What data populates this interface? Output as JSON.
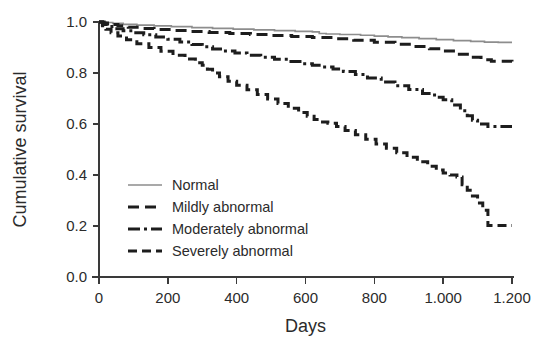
{
  "chart_data": {
    "type": "line",
    "title": "",
    "subtitle": "",
    "xlabel": "Days",
    "ylabel": "Cumulative survival",
    "xlim": [
      0,
      1200
    ],
    "ylim": [
      0.0,
      1.0
    ],
    "grid": false,
    "legend_position": "inside-lower-left",
    "x_ticks": [
      0,
      200,
      400,
      600,
      800,
      1000,
      1200
    ],
    "x_tick_labels": [
      "0",
      "200",
      "400",
      "600",
      "800",
      "1.000",
      "1.200"
    ],
    "y_ticks": [
      0.0,
      0.2,
      0.4,
      0.6,
      0.8,
      1.0
    ],
    "y_tick_labels": [
      "0.0",
      "0.2",
      "0.4",
      "0.6",
      "0.8",
      "1.0"
    ],
    "step_function": true,
    "series": [
      {
        "name": "Normal",
        "color": "#8d8d8d",
        "line_style": "solid",
        "dasharray": "",
        "width": 1.7,
        "x": [
          0,
          20,
          40,
          70,
          110,
          160,
          210,
          270,
          330,
          390,
          450,
          510,
          570,
          620,
          640,
          660,
          700,
          760,
          800,
          840,
          880,
          930,
          980,
          1030,
          1080,
          1120,
          1160,
          1200
        ],
        "y": [
          1.0,
          0.998,
          0.995,
          0.991,
          0.988,
          0.985,
          0.982,
          0.978,
          0.975,
          0.972,
          0.969,
          0.966,
          0.963,
          0.961,
          0.955,
          0.953,
          0.951,
          0.948,
          0.945,
          0.942,
          0.939,
          0.935,
          0.931,
          0.927,
          0.924,
          0.921,
          0.92,
          0.92
        ]
      },
      {
        "name": "Mildly abnormal",
        "color": "#1d1d1d",
        "line_style": "long-dash",
        "dasharray": "11 6",
        "width": 3.0,
        "x": [
          0,
          15,
          30,
          55,
          85,
          120,
          160,
          210,
          260,
          320,
          380,
          440,
          500,
          560,
          620,
          680,
          740,
          800,
          860,
          910,
          960,
          1000,
          1040,
          1080,
          1110,
          1140,
          1200
        ],
        "y": [
          1.0,
          0.996,
          0.99,
          0.985,
          0.979,
          0.975,
          0.971,
          0.967,
          0.963,
          0.959,
          0.955,
          0.951,
          0.947,
          0.943,
          0.939,
          0.934,
          0.928,
          0.921,
          0.913,
          0.904,
          0.895,
          0.886,
          0.874,
          0.862,
          0.852,
          0.846,
          0.845
        ]
      },
      {
        "name": "Moderately abnormal",
        "color": "#1d1d1d",
        "line_style": "dash-dot",
        "dasharray": "12 4 3 4",
        "width": 3.0,
        "x": [
          0,
          10,
          25,
          45,
          70,
          100,
          130,
          165,
          200,
          235,
          270,
          300,
          330,
          360,
          395,
          430,
          470,
          510,
          550,
          590,
          620,
          650,
          680,
          710,
          745,
          780,
          820,
          860,
          900,
          940,
          975,
          1000,
          1025,
          1050,
          1070,
          1085,
          1100,
          1130,
          1200
        ],
        "y": [
          1.0,
          0.99,
          0.982,
          0.974,
          0.966,
          0.958,
          0.95,
          0.941,
          0.932,
          0.922,
          0.912,
          0.903,
          0.894,
          0.886,
          0.878,
          0.87,
          0.862,
          0.854,
          0.845,
          0.836,
          0.83,
          0.824,
          0.816,
          0.806,
          0.794,
          0.78,
          0.765,
          0.75,
          0.735,
          0.72,
          0.705,
          0.695,
          0.675,
          0.652,
          0.632,
          0.615,
          0.6,
          0.59,
          0.59
        ]
      },
      {
        "name": "Severely abnormal",
        "color": "#1d1d1d",
        "line_style": "dashed",
        "dasharray": "9 5",
        "width": 3.0,
        "x": [
          0,
          10,
          20,
          35,
          55,
          80,
          110,
          145,
          180,
          215,
          250,
          280,
          300,
          315,
          330,
          350,
          375,
          400,
          430,
          460,
          490,
          520,
          550,
          580,
          605,
          625,
          645,
          665,
          690,
          715,
          745,
          775,
          805,
          835,
          865,
          895,
          925,
          955,
          980,
          1000,
          1020,
          1040,
          1055,
          1070,
          1085,
          1100,
          1115,
          1130,
          1200
        ],
        "y": [
          1.0,
          0.985,
          0.972,
          0.958,
          0.945,
          0.93,
          0.915,
          0.9,
          0.885,
          0.87,
          0.855,
          0.84,
          0.83,
          0.815,
          0.8,
          0.785,
          0.768,
          0.752,
          0.734,
          0.716,
          0.698,
          0.68,
          0.662,
          0.645,
          0.63,
          0.618,
          0.608,
          0.603,
          0.59,
          0.575,
          0.558,
          0.54,
          0.522,
          0.505,
          0.487,
          0.47,
          0.452,
          0.434,
          0.42,
          0.408,
          0.4,
          0.392,
          0.362,
          0.34,
          0.318,
          0.29,
          0.262,
          0.202,
          0.202
        ]
      }
    ]
  },
  "legend": {
    "items": [
      {
        "label": "Normal"
      },
      {
        "label": "Mildly abnormal"
      },
      {
        "label": "Moderately abnormal"
      },
      {
        "label": "Severely abnormal"
      }
    ]
  },
  "colors": {
    "normal_line": "#8d8d8d",
    "abnormal_line": "#1d1d1d",
    "axis": "#3a3a3a",
    "text": "#2b2b2b",
    "background": "#ffffff"
  }
}
